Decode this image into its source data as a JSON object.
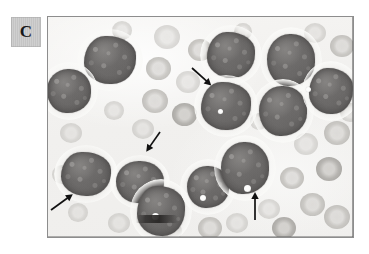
{
  "figure": {
    "panel_label": "C",
    "caption_text": "",
    "image_kind": "light-microscopy-blood-smear"
  },
  "micrograph": {
    "background_color": "#f1f0ee",
    "frame_border_color": "#8d8d8d",
    "label_box_color": "#c8c8c8",
    "label_text_color": "#18181a",
    "nucleus_color": "#6f6d6c",
    "cytoplasm_color": "#f6f5f2",
    "rbc_color": "#c4c2bf",
    "arrow_color": "#111111"
  },
  "annotations": {
    "arrows": [
      {
        "name": "arrow-upper-center",
        "direction": "down-right",
        "x": 144,
        "y": 44,
        "length": 26,
        "angle": 42
      },
      {
        "name": "arrow-middle-center",
        "direction": "down-left",
        "x": 112,
        "y": 108,
        "length": 24,
        "angle": 125
      },
      {
        "name": "arrow-lower-left",
        "direction": "up-right",
        "x": 3,
        "y": 186,
        "length": 27,
        "angle": -36
      },
      {
        "name": "arrow-lower-center",
        "direction": "up",
        "x": 207,
        "y": 196,
        "length": 28,
        "angle": -90
      }
    ],
    "arrow_count": 4
  },
  "cells": {
    "blasts": [
      {
        "name": "blast-top-left",
        "x": 29,
        "y": 12,
        "w": 66,
        "h": 62
      },
      {
        "name": "blast-left-upper",
        "x": -8,
        "y": 45,
        "w": 58,
        "h": 58
      },
      {
        "name": "blast-left-lower",
        "x": 6,
        "y": 128,
        "w": 64,
        "h": 58
      },
      {
        "name": "blast-center-lower",
        "x": 62,
        "y": 138,
        "w": 60,
        "h": 54
      },
      {
        "name": "blast-bottom-center",
        "x": 82,
        "y": 162,
        "w": 62,
        "h": 64
      },
      {
        "name": "blast-center-right",
        "x": 132,
        "y": 142,
        "w": 56,
        "h": 56
      },
      {
        "name": "blast-cluster-top-a",
        "x": 152,
        "y": 8,
        "w": 62,
        "h": 60
      },
      {
        "name": "blast-cluster-top-b",
        "x": 212,
        "y": 10,
        "w": 62,
        "h": 66
      },
      {
        "name": "blast-cluster-mid-a",
        "x": 146,
        "y": 58,
        "w": 64,
        "h": 62
      },
      {
        "name": "blast-cluster-mid-b",
        "x": 204,
        "y": 62,
        "w": 62,
        "h": 64
      },
      {
        "name": "blast-cluster-right",
        "x": 254,
        "y": 44,
        "w": 58,
        "h": 60
      },
      {
        "name": "blast-cluster-lower",
        "x": 166,
        "y": 118,
        "w": 62,
        "h": 66
      }
    ],
    "blast_count": 12,
    "vacuoles": [
      {
        "name": "vacuole-a",
        "x": 104,
        "y": 196,
        "d": 7
      },
      {
        "name": "vacuole-b",
        "x": 152,
        "y": 178,
        "d": 6
      },
      {
        "name": "vacuole-c",
        "x": 196,
        "y": 168,
        "d": 7
      },
      {
        "name": "vacuole-d",
        "x": 170,
        "y": 92,
        "d": 5
      },
      {
        "name": "vacuole-e",
        "x": 258,
        "y": 70,
        "d": 5
      }
    ],
    "rbcs": [
      {
        "x": 106,
        "y": 8,
        "d": 26,
        "style": "faint"
      },
      {
        "x": 140,
        "y": 22,
        "d": 24,
        "style": ""
      },
      {
        "x": 98,
        "y": 40,
        "d": 25,
        "style": ""
      },
      {
        "x": 128,
        "y": 54,
        "d": 24,
        "style": "faint"
      },
      {
        "x": 94,
        "y": 72,
        "d": 26,
        "style": ""
      },
      {
        "x": 124,
        "y": 86,
        "d": 25,
        "style": "deep"
      },
      {
        "x": 84,
        "y": 102,
        "d": 22,
        "style": "faint"
      },
      {
        "x": 56,
        "y": 84,
        "d": 20,
        "style": "faint"
      },
      {
        "x": 158,
        "y": 30,
        "d": 18,
        "style": "faint"
      },
      {
        "x": 256,
        "y": 6,
        "d": 22,
        "style": "faint"
      },
      {
        "x": 282,
        "y": 18,
        "d": 24,
        "style": ""
      },
      {
        "x": 276,
        "y": 104,
        "d": 26,
        "style": ""
      },
      {
        "x": 246,
        "y": 116,
        "d": 24,
        "style": "faint"
      },
      {
        "x": 268,
        "y": 140,
        "d": 26,
        "style": "deep"
      },
      {
        "x": 232,
        "y": 150,
        "d": 24,
        "style": ""
      },
      {
        "x": 252,
        "y": 176,
        "d": 25,
        "style": ""
      },
      {
        "x": 210,
        "y": 182,
        "d": 22,
        "style": "faint"
      },
      {
        "x": 276,
        "y": 188,
        "d": 26,
        "style": ""
      },
      {
        "x": 224,
        "y": 200,
        "d": 24,
        "style": "deep"
      },
      {
        "x": 178,
        "y": 196,
        "d": 22,
        "style": "faint"
      },
      {
        "x": 150,
        "y": 200,
        "d": 24,
        "style": ""
      },
      {
        "x": 112,
        "y": 204,
        "d": 22,
        "style": "faint"
      },
      {
        "x": 60,
        "y": 196,
        "d": 22,
        "style": "faint"
      },
      {
        "x": 20,
        "y": 186,
        "d": 20,
        "style": "faint"
      },
      {
        "x": 4,
        "y": 148,
        "d": 20,
        "style": "faint"
      },
      {
        "x": 12,
        "y": 106,
        "d": 22,
        "style": "faint"
      },
      {
        "x": 186,
        "y": 126,
        "d": 20,
        "style": "faint"
      },
      {
        "x": 202,
        "y": 96,
        "d": 18,
        "style": "faint"
      },
      {
        "x": 288,
        "y": 62,
        "d": 22,
        "style": "faint"
      },
      {
        "x": 292,
        "y": 86,
        "d": 20,
        "style": "faint"
      },
      {
        "x": 64,
        "y": 4,
        "d": 20,
        "style": "faint"
      },
      {
        "x": 186,
        "y": 6,
        "d": 18,
        "style": "faint"
      }
    ],
    "rbc_count": 32
  }
}
